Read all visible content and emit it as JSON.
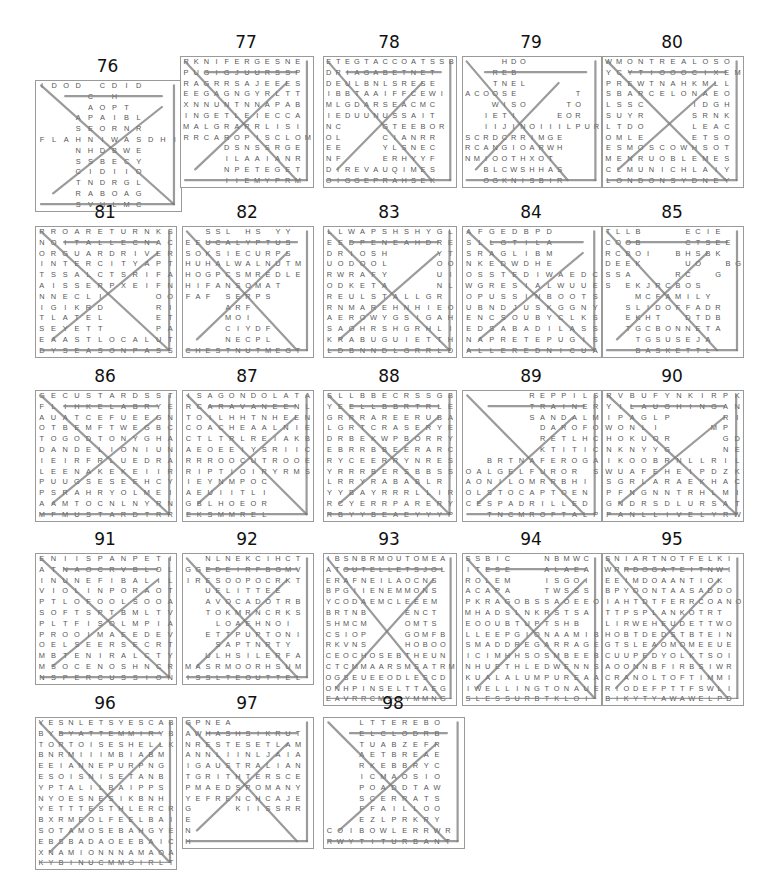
{
  "puzzles": [
    {
      "number": "76",
      "x": 35,
      "y": 80,
      "w": 145,
      "rows": [
        "IDOD CDID",
        "    C H  ",
        "    AOPT ",
        "   APAIBL",
        "   SEORNR",
        "FLAHNIWASDHI",
        "   NHDBWE",
        "   SSBECY",
        "   CIDIIO",
        "   TNDRGL",
        "   RABOAG",
        "   SVHLMC"
      ]
    },
    {
      "number": "77",
      "x": 180,
      "y": 56,
      "w": 132,
      "rows": [
        "RKNIFERGESNE",
        "PUGIGJUURSSP",
        "RAGRRSAJEEES",
        "EEGAGNGYRLTT",
        "XNNUNTNNAPAB",
        "INGETLEIECCA",
        "MALGRARRLISI",
        "RRCAROPISCLOM",
        "    DSNSSRGE",
        "    ILAAIANR",
        "    NPETEGET",
        "    IIEMYPRM"
      ]
    },
    {
      "number": "78",
      "x": 323,
      "y": 56,
      "w": 132,
      "rows": [
        "ETEGTACCOATSSB",
        "DRIAGABETNET",
        "DEULBNLSRESE",
        "IBBTAAIFFCEWI",
        "MLGDARSEACMC",
        "IEDUUNUSSAIT",
        "NC    GTEEBOR",
        "OL    CIANRR",
        "EE    YLSNEC",
        "NF    ERHYYF",
        "DIREVAUQIMES",
        "OIGGEPRAHSEK"
      ]
    },
    {
      "number": "79",
      "x": 462,
      "y": 56,
      "w": 138,
      "rows": [
        "    HDO      ",
        "   REB       ",
        "   TNEL      ",
        "ACOOSE      T",
        "   WISO    TO",
        "  IETI    EOR",
        "  IIJINOIIILPUR",
        "SCRDCRRIMGE ",
        "RCANGIOARWH ",
        "NMIOOTHXOT  ",
        "  BLCWSHHAS  ",
        "  OGKNISBIR  "
      ]
    },
    {
      "number": "80",
      "x": 602,
      "y": 56,
      "w": 140,
      "rows": [
        "WMONTREALOSO",
        "YCYTIOOOCIXEM",
        "PREWTNAHKMLL",
        "SBARCELONAEO",
        "LSSC    IDGH",
        "SUYR    SRNK",
        "LTDO    LEAC",
        "OMLE    ETSO",
        "ESMOSCOWHSOT",
        "MENRUOBLEMES",
        "CLMUNICHLAIY",
        "LONDONSYDNEY"
      ]
    },
    {
      "number": "81",
      "x": 35,
      "y": 226,
      "w": 140,
      "rows": [
        "RROARETURNKS",
        "NOITALLECNAC",
        "ORGUARDRIVER",
        "INTERCITYAPT",
        "TSSALCTSRIFA",
        "AISSERPXEIFN",
        "NNECLI    OO",
        "IGIKRD    RI",
        "TLATEL    ET",
        "SEYETT    PA",
        "EAASTLOCALUT",
        "DYSEASONPASS"
      ]
    },
    {
      "number": "82",
      "x": 182,
      "y": 226,
      "w": 130,
      "rows": [
        "  SSL HS YY ",
        "EEUCALYPTUS ",
        "SOKSIECURPS ",
        "HUHALWALNUTM",
        "HOGPCSMREDLE",
        "HIFANSOMAT  ",
        "FAF SERPS   ",
        "    ARF      ",
        "    MOI      ",
        "    CIYDF    ",
        "    NECPL    ",
        "CHESTNUTMEGT"
      ]
    },
    {
      "number": "83",
      "x": 323,
      "y": 226,
      "w": 132,
      "rows": [
        "LLWAPSHSHYGL",
        "EEDPENEAHDRE",
        "DRIOSH    YT",
        "UODOOL    OO",
        "RWRAFY    UI",
        "ODKETA    NL",
        "REULSTALLGR",
        "RNMAREHNHIEO",
        "AEROWYGSIGAH",
        "SAGHRSHGRHLI",
        "KRABUGUIETTH",
        "LDBNNDLGRRLD"
      ]
    },
    {
      "number": "84",
      "x": 462,
      "y": 226,
      "w": 138,
      "rows": [
        "AFGEDBPD    ",
        "SLLGTILA    ",
        "SRAGLIBM    ",
        "NKEDWDHE    ",
        "OSSTEDIWAEDC",
        "WGRESIALWUUE",
        "OPUSSINBOOTS",
        "UBNDJUSKGGNY",
        "ENCSOUBYCLKS",
        "EDSABADILASS",
        "NAPRETEPUGIS",
        "ALLEREDNICUA"
      ]
    },
    {
      "number": "85",
      "x": 602,
      "y": 226,
      "w": 140,
      "rows": [
        "TLLB    ECIE",
        "COOB    CTSEE",
        "RCBOI  BHSBK",
        "DEEK    UO  BG",
        "SSA    RC  G",
        "S EKJRCBOS  ",
        "   MCFAMILY  ",
        "  SLIDOFFADR ",
        "  EKHT  DTDB ",
        "  TGCBONNETA ",
        "   TGSUSEJA  ",
        "   BASKETTL  "
      ]
    },
    {
      "number": "86",
      "x": 35,
      "y": 390,
      "w": 140,
      "rows": [
        "GECUSTARDSST",
        "FLIHKELABRYE",
        "AUATCEFUEEGN",
        "OTBEMFTWEGBC",
        "TOGODTONYGHA",
        "DANDELIONIUN",
        "IEIRFRLUEDRA",
        "LEENAKEKEIIR",
        "PUUGSESEEHCY",
        "PSRAHRYOLMEI",
        "AAMTOCNLNYRN",
        "MFMUSTARDTRR"
      ]
    },
    {
      "number": "87",
      "x": 182,
      "y": 390,
      "w": 130,
      "rows": [
        "ISAGONDOLATA",
        "RCARAVANEENL",
        "TOILHHTNHEEN",
        "COACHEAALNIE",
        "CTLTRLREIAKB",
        "AEOEEIYSRIIC",
        "RRROOCUTROOE",
        "RIPTIOIRYRMS",
        "IEYNMPOC    ",
        "AEUIITLI    ",
        "GBLHOEOR    ",
        "EKSMMREL    "
      ]
    },
    {
      "number": "88",
      "x": 323,
      "y": 390,
      "w": 132,
      "rows": [
        "SLLBBECRSSGB",
        "YEELLBBRTRLE",
        "GRRRAREERUBA",
        "LGRTCRASERYE",
        "DRBEKWPBORRY",
        "EBRRBBEERARC",
        "RYCEERRYNRES",
        "YRRRBERSBBSS",
        "LRRYRABABLR",
        "YYBAYRRRLLIR",
        "RCYERRPARERY",
        "RBYYBEAEYYYP"
      ]
    },
    {
      "number": "89",
      "x": 462,
      "y": 390,
      "w": 138,
      "rows": [
        "      REPPILS",
        "      TRAINER",
        "      SANDALM",
        "       DAROFO",
        "       RETLHC",
        "       KTITIC",
        "  BRTNAFEROGA",
        "OALGELFUROR S",
        "AONILOMRRBHI",
        "OLSTOCAPTOEN",
        "CESPADRILLED",
        "  TNCMROFTALP"
      ]
    },
    {
      "number": "90",
      "x": 602,
      "y": 390,
      "w": 140,
      "rows": [
        "RVBUFYNKIRPK",
        "YILAUGHINGAN",
        "IPAGLP    RI",
        "WONLI    MP",
        "HOKUOR    GD",
        "NKNYYG    NE",
        "IKOOBRNLLRIL",
        "WUAFEHEIPDZK",
        "SGRLARAEKHAC",
        "PFNGNNTRHLMI",
        "GNDRSDLURSAT",
        "PANLLIVELYRW"
      ]
    },
    {
      "number": "91",
      "x": 35,
      "y": 553,
      "w": 140,
      "rows": [
        "ENIISPANPETI",
        "ATNAOCRVBLOL",
        "INUNEFIBALIL",
        "VIOLINPORAOT",
        "PTLOFOOLSOOA",
        "SOFTSPTBMLTV",
        "PLTFISOLMPIA",
        "PROOIMAEEDEV",
        "OELSEERSECRT",
        "MBTENIRALCTY",
        "MSOCENOSHNCR",
        "NSPERCUSSION"
      ]
    },
    {
      "number": "92",
      "x": 182,
      "y": 553,
      "w": 130,
      "rows": [
        "  NLNEKCIHCT ",
        "GGEDEIRFBGMV",
        "IRESOOPOCRKT",
        "  UELITTEE  ",
        "  AVOCADOTRB ",
        "  TOKMRNCRKS ",
        "   LOAEHNOI  ",
        "  ETTPUPTONI ",
        "   SAPTNRTY  ",
        "  ULHSILERFA ",
        "MASRMOORHSUM",
        "ISSLTEOUTTEL"
      ]
    },
    {
      "number": "93",
      "x": 323,
      "y": 553,
      "w": 132,
      "rows": [
        "IBSNBRMOUTOMEA",
        "ATOUTELLETSJOL",
        "ERAFNEILAOCNS",
        "BPGIIENEMMONS",
        "YCODAEMCLEEEM",
        "BRTNB    ENCT",
        "SHMCM    OMTS",
        "CSIOP    GOMFB",
        "RKVNS    HOBOO",
        "CEOCHOSEBTHEUN",
        "CTCMMAARSMSATRM",
        "OGSEUEEODLESCD",
        "ONHPINSELTTAEG",
        "EAVRRCMSTYMMNG"
      ]
    },
    {
      "number": "94",
      "x": 462,
      "y": 553,
      "w": 138,
      "rows": [
        "SSBIC   NBMWC",
        "ITESE   ALAEA",
        "ROLEM   ISGOI",
        "ACAPA   TWSSS",
        "PKRAGOBSSAOEEO",
        "MHADSLNKRSTSA",
        "EOOUBTUPTSHB",
        "LLEEPGIONAAMIB",
        "SMADDREGARRAGE",
        "ICIMHHSOSMBEEB",
        "NHUETHLEDWENNS",
        "KUALALUMPUREAA",
        "IWELLINGTONAUE",
        "SLESSURBTKLOI"
      ]
    },
    {
      "number": "95",
      "x": 602,
      "y": 553,
      "w": 140,
      "rows": [
        "SNIARTNOTFELKI",
        "WRRDOGATEITNWI",
        "EEIMDOAANTIOK",
        "BPYOONTAASADDO",
        "IAHTDTFERRCOANO",
        "TTPSPLANKOTRT",
        "LIRWEHEUDETTWO",
        "HOBTDEDSTBTEIN",
        "GTSLEAOMOMEEUE",
        "CUUPEDYOLKTSOI",
        "AOONNBFIRBSIWR",
        "CRANOLTOFTIMMI",
        "RIODEFPTTFSWLI",
        "BIKYTYAWAWELPD"
      ]
    },
    {
      "number": "96",
      "x": 35,
      "y": 717,
      "w": 140,
      "rows": [
        "YESNLETSYESCAB",
        "BYBYATTEMMIRYB",
        "TORTOISESHELLK",
        "BNRMIIIMBIABM",
        "EEIANNEPURPNG",
        "ESOISNISETANB",
        "YPTALILBAIPPS",
        "NYOESNESIKBNH",
        "YETTTESTHLERCR",
        "BXRMEOLFEELBAI",
        "SOTAMOSEBAHGYE",
        "EBSBADAOEEBAIC",
        "XNAMIONNNAMAOA",
        "KYBINUCMMOIRLT"
      ]
    },
    {
      "number": "97",
      "x": 182,
      "y": 717,
      "w": 130,
      "rows": [
        "GPNEA        ",
        "AWHASHSIKRUT",
        "NRESTESETLAM",
        "ANNLIINLJAIA",
        "IGAUSTRALIAN",
        "TGRITHTERSCE",
        "PMAEDSPOMANY",
        "YEFRENCHCAJE",
        "G    KIISSRR",
        "E            ",
        "N            ",
        "H            "
      ]
    },
    {
      "number": "98",
      "x": 323,
      "y": 717,
      "w": 140,
      "rows": [
        "   LTTEREBO  ",
        "   ELCLODRB  ",
        "   TUABZEFR  ",
        "   AETBREAE  ",
        "   RKEBBRYC  ",
        "   ICMAOSIO  ",
        "   POADDTAW  ",
        "   SCERRATS  ",
        "   FFAILLOO  ",
        "   EZLPRKRY  ",
        "COIBOWLERRWR",
        "RWYTITURBANT"
      ]
    }
  ]
}
